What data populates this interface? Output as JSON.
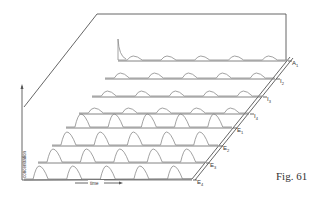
{
  "figure": {
    "caption": "Fig. 61",
    "axis_vertical_label": "concentration",
    "axis_horizontal_label": "time",
    "rows": [
      {
        "label": "A",
        "sub": "1",
        "kind": "initial-spike"
      },
      {
        "label": "I",
        "sub": "2",
        "kind": "small-peaks"
      },
      {
        "label": "I",
        "sub": "3",
        "kind": "small-peaks"
      },
      {
        "label": "I",
        "sub": "4",
        "kind": "small-peaks"
      },
      {
        "label": "E",
        "sub": "1",
        "kind": "large-peaks"
      },
      {
        "label": "E",
        "sub": "2",
        "kind": "large-peaks"
      },
      {
        "label": "E",
        "sub": "3",
        "kind": "large-peaks"
      },
      {
        "label": "E",
        "sub": "4",
        "kind": "large-peaks"
      }
    ],
    "colors": {
      "ink": "#555555",
      "trace": "#8a8a8a",
      "background": "#ffffff"
    }
  }
}
